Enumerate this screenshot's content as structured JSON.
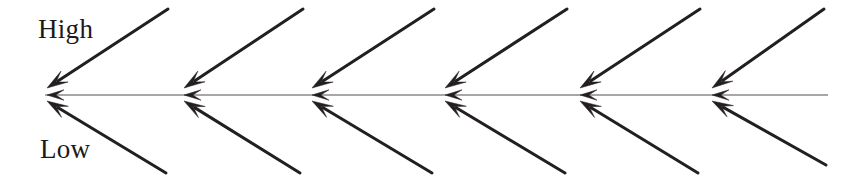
{
  "diagram": {
    "name": "fishbone-arrow-diagram",
    "type": "arrow-diagram",
    "width": 862,
    "height": 182,
    "background_color": "#ffffff",
    "labels": {
      "high": "High",
      "low": "Low"
    },
    "label_color": "#1a1a1a",
    "arrow_color": "#231f20",
    "spine_color": "#8a8a8a",
    "spine": {
      "name": "horizontal-spine",
      "y": 95,
      "x_start": 45,
      "x_end": 828,
      "stroke_width": 1.4,
      "arrowhead_count": 6
    },
    "branch_count": 6,
    "junction_x": [
      45,
      182,
      310,
      443,
      578,
      710
    ],
    "upper_branches": [
      {
        "name": "upper-arrow-1",
        "tail_x": 168,
        "tail_y": 9,
        "head_x": 47,
        "head_y": 88
      },
      {
        "name": "upper-arrow-2",
        "tail_x": 303,
        "tail_y": 9,
        "head_x": 184,
        "head_y": 88
      },
      {
        "name": "upper-arrow-3",
        "tail_x": 434,
        "tail_y": 9,
        "head_x": 312,
        "head_y": 88
      },
      {
        "name": "upper-arrow-4",
        "tail_x": 567,
        "tail_y": 9,
        "head_x": 445,
        "head_y": 88
      },
      {
        "name": "upper-arrow-5",
        "tail_x": 700,
        "tail_y": 9,
        "head_x": 580,
        "head_y": 88
      },
      {
        "name": "upper-arrow-6",
        "tail_x": 824,
        "tail_y": 9,
        "head_x": 712,
        "head_y": 88
      }
    ],
    "lower_branches": [
      {
        "name": "lower-arrow-1",
        "tail_x": 166,
        "tail_y": 173,
        "head_x": 47,
        "head_y": 101
      },
      {
        "name": "lower-arrow-2",
        "tail_x": 300,
        "tail_y": 173,
        "head_x": 184,
        "head_y": 101
      },
      {
        "name": "lower-arrow-3",
        "tail_x": 432,
        "tail_y": 173,
        "head_x": 312,
        "head_y": 101
      },
      {
        "name": "lower-arrow-4",
        "tail_x": 565,
        "tail_y": 173,
        "head_x": 445,
        "head_y": 101
      },
      {
        "name": "lower-arrow-5",
        "tail_x": 698,
        "tail_y": 173,
        "head_x": 580,
        "head_y": 101
      },
      {
        "name": "lower-arrow-6",
        "tail_x": 826,
        "tail_y": 165,
        "head_x": 712,
        "head_y": 101
      }
    ]
  }
}
